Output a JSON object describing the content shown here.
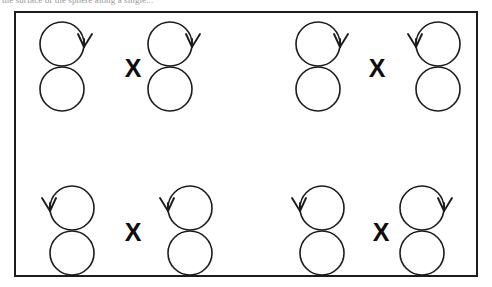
{
  "caption": {
    "clipped_text_line": "the surface of the sphere along a single..."
  },
  "figure": {
    "frame_label": "figure-panel",
    "stroke_color": "#1c1c1c",
    "background_color": "#ffffff",
    "operator_symbol": "X",
    "pairs": [
      {
        "id": "pair-top-left",
        "row": "top",
        "column": "left",
        "operator": "X",
        "left_operand": {
          "name": "figure-eight-1",
          "arrow_side": "right",
          "arrow_direction": "clockwise"
        },
        "right_operand": {
          "name": "figure-eight-2",
          "arrow_side": "right",
          "arrow_direction": "clockwise"
        }
      },
      {
        "id": "pair-top-right",
        "row": "top",
        "column": "right",
        "operator": "X",
        "left_operand": {
          "name": "figure-eight-3",
          "arrow_side": "right",
          "arrow_direction": "clockwise"
        },
        "right_operand": {
          "name": "figure-eight-4",
          "arrow_side": "left",
          "arrow_direction": "counter-clockwise"
        }
      },
      {
        "id": "pair-bottom-left",
        "row": "bottom",
        "column": "left",
        "operator": "X",
        "left_operand": {
          "name": "figure-eight-5",
          "arrow_side": "left",
          "arrow_direction": "counter-clockwise"
        },
        "right_operand": {
          "name": "figure-eight-6",
          "arrow_side": "left",
          "arrow_direction": "counter-clockwise"
        }
      },
      {
        "id": "pair-bottom-right",
        "row": "bottom",
        "column": "right",
        "operator": "X",
        "left_operand": {
          "name": "figure-eight-7",
          "arrow_side": "left",
          "arrow_direction": "counter-clockwise"
        },
        "right_operand": {
          "name": "figure-eight-8",
          "arrow_side": "right",
          "arrow_direction": "clockwise"
        }
      }
    ]
  }
}
